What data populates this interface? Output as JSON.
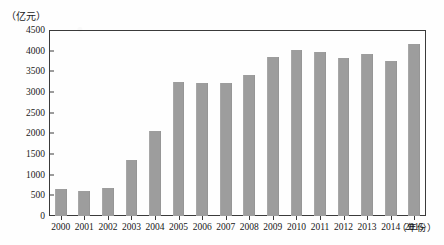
{
  "chart_data": {
    "type": "bar",
    "title": "",
    "subtitle": "",
    "unit_label": "（亿元）",
    "xlabel": "（年份）",
    "ylabel": "",
    "categories": [
      "2000",
      "2001",
      "2002",
      "2003",
      "2004",
      "2005",
      "2006",
      "2007",
      "2008",
      "2009",
      "2010",
      "2011",
      "2012",
      "2013",
      "2014",
      "2015"
    ],
    "values": [
      650,
      600,
      680,
      1350,
      2050,
      3250,
      3220,
      3230,
      3420,
      3850,
      4020,
      3970,
      3830,
      3930,
      3760,
      4160
    ],
    "ylim": [
      0,
      4500
    ],
    "ytick_values": [
      0,
      500,
      1000,
      1500,
      2000,
      2500,
      3000,
      3500,
      4000,
      4500
    ],
    "ytick_labels": [
      "0",
      "500",
      "1000",
      "1500",
      "2000",
      "2500",
      "3000",
      "3500",
      "4000",
      "4500"
    ],
    "grid": false,
    "legend": null,
    "legend_position": "none",
    "series": [
      {
        "name": "",
        "values": [
          650,
          600,
          680,
          1350,
          2050,
          3250,
          3220,
          3230,
          3420,
          3850,
          4020,
          3970,
          3830,
          3930,
          3760,
          4160
        ]
      }
    ],
    "bar_color": "#9d9d9d",
    "axis_color": "#3a3a3a",
    "text_color": "#191919",
    "background_color": "#fefefe"
  }
}
